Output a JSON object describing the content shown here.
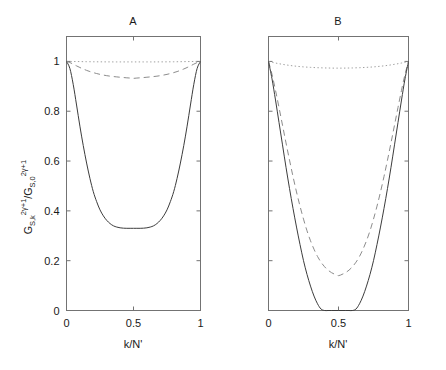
{
  "figure": {
    "background_color": "#ffffff",
    "axis_color": "#737373",
    "solid_color": "#3c3c3c",
    "dashed_color": "#8c8c8c",
    "dotted_color": "#a0a0a0",
    "shared_ylabel": {
      "base1": "G",
      "sub1": "S,k",
      "sup1": "2γ+1",
      "separator": "/",
      "base2": "G",
      "sub2": "S,0",
      "sup2": "2γ+1",
      "plain": "G_{S,k}^{2γ+1}/G_{S,0}^{2γ+1}"
    }
  },
  "chart_data": [
    {
      "type": "line",
      "title": "A",
      "xlabel": "k/N'",
      "ylabel": "G_{S,k}^{2γ+1}/G_{S,0}^{2γ+1}",
      "xlim": [
        0,
        1
      ],
      "ylim": [
        0,
        1.1
      ],
      "xticks": [
        0,
        0.5,
        1
      ],
      "xticklabels": [
        "0",
        "0.5",
        "1"
      ],
      "yticks": [
        0,
        0.2,
        0.4,
        0.6,
        0.8,
        1
      ],
      "yticklabels": [
        "0",
        "0.2",
        "0.4",
        "0.6",
        "0.8",
        "1"
      ],
      "grid": false,
      "legend": "none",
      "x": [
        0,
        0.025,
        0.05,
        0.075,
        0.1,
        0.125,
        0.15,
        0.175,
        0.2,
        0.225,
        0.25,
        0.275,
        0.3,
        0.325,
        0.35,
        0.375,
        0.4,
        0.425,
        0.45,
        0.475,
        0.5,
        0.525,
        0.55,
        0.575,
        0.6,
        0.625,
        0.65,
        0.675,
        0.7,
        0.725,
        0.75,
        0.775,
        0.8,
        0.825,
        0.85,
        0.875,
        0.9,
        0.925,
        0.95,
        0.975,
        1
      ],
      "series": [
        {
          "name": "solid",
          "style": "solid",
          "min_value": 0.33,
          "min_at_x": 0.5,
          "values": [
            1.0,
            0.972,
            0.908,
            0.825,
            0.74,
            0.662,
            0.592,
            0.53,
            0.477,
            0.437,
            0.404,
            0.38,
            0.362,
            0.349,
            0.34,
            0.335,
            0.332,
            0.3305,
            0.33,
            0.33,
            0.33,
            0.33,
            0.33,
            0.3305,
            0.332,
            0.335,
            0.34,
            0.349,
            0.362,
            0.38,
            0.404,
            0.437,
            0.477,
            0.53,
            0.592,
            0.662,
            0.74,
            0.825,
            0.908,
            0.972,
            1.0
          ]
        },
        {
          "name": "dashed",
          "style": "dashed",
          "min_value": 0.932,
          "min_at_x": 0.5,
          "values": [
            1.0,
            0.9955,
            0.989,
            0.982,
            0.9755,
            0.9695,
            0.964,
            0.9592,
            0.955,
            0.9513,
            0.948,
            0.9452,
            0.9428,
            0.9408,
            0.9392,
            0.9378,
            0.9365,
            0.9352,
            0.9341,
            0.9332,
            0.932,
            0.9332,
            0.9341,
            0.9352,
            0.9365,
            0.9378,
            0.9392,
            0.9408,
            0.9428,
            0.9452,
            0.948,
            0.9513,
            0.955,
            0.9592,
            0.964,
            0.9695,
            0.9755,
            0.982,
            0.989,
            0.9955,
            1.0
          ]
        },
        {
          "name": "dotted",
          "style": "dotted",
          "min_value": 0.998,
          "min_at_x": 0.5,
          "values": [
            1.0,
            0.9999,
            0.9997,
            0.9995,
            0.9993,
            0.9991,
            0.9989,
            0.9987,
            0.9985,
            0.9984,
            0.9983,
            0.9982,
            0.9981,
            0.9981,
            0.998,
            0.998,
            0.998,
            0.998,
            0.998,
            0.998,
            0.998,
            0.998,
            0.998,
            0.998,
            0.998,
            0.998,
            0.998,
            0.9981,
            0.9981,
            0.9982,
            0.9983,
            0.9984,
            0.9985,
            0.9987,
            0.9989,
            0.9991,
            0.9993,
            0.9995,
            0.9997,
            0.9999,
            1.0
          ]
        }
      ]
    },
    {
      "type": "line",
      "title": "B",
      "xlabel": "k/N'",
      "ylabel": "G_{S,k}^{2γ+1}/G_{S,0}^{2γ+1}",
      "xlim": [
        0,
        1
      ],
      "ylim": [
        0,
        1.1
      ],
      "xticks": [
        0,
        0.5,
        1
      ],
      "xticklabels": [
        "0",
        "0.5",
        "1"
      ],
      "yticks": [
        0,
        0.2,
        0.4,
        0.6,
        0.8,
        1
      ],
      "yticklabels": [
        "0",
        "0.2",
        "0.4",
        "0.6",
        "0.8",
        "1"
      ],
      "grid": false,
      "legend": "none",
      "x": [
        0,
        0.025,
        0.05,
        0.075,
        0.1,
        0.125,
        0.15,
        0.175,
        0.2,
        0.225,
        0.25,
        0.275,
        0.3,
        0.325,
        0.35,
        0.375,
        0.4,
        0.425,
        0.45,
        0.475,
        0.5,
        0.525,
        0.55,
        0.575,
        0.6,
        0.625,
        0.65,
        0.675,
        0.7,
        0.725,
        0.75,
        0.775,
        0.8,
        0.825,
        0.85,
        0.875,
        0.9,
        0.925,
        0.95,
        0.975,
        1
      ],
      "series": [
        {
          "name": "solid",
          "style": "solid",
          "min_value": 0.0,
          "min_at_x": 0.5,
          "flat_zero_range": [
            0.37,
            0.63
          ],
          "values": [
            1.0,
            0.93,
            0.845,
            0.755,
            0.665,
            0.575,
            0.49,
            0.41,
            0.335,
            0.265,
            0.2,
            0.145,
            0.098,
            0.058,
            0.027,
            0.006,
            0.0,
            0.0,
            0.0,
            0.0,
            0.0,
            0.0,
            0.0,
            0.0,
            0.0,
            0.006,
            0.027,
            0.058,
            0.098,
            0.145,
            0.2,
            0.265,
            0.335,
            0.41,
            0.49,
            0.575,
            0.665,
            0.755,
            0.845,
            0.93,
            1.0
          ]
        },
        {
          "name": "dashed",
          "style": "dashed",
          "min_value": 0.14,
          "min_at_x": 0.5,
          "values": [
            1.0,
            0.948,
            0.884,
            0.815,
            0.744,
            0.673,
            0.604,
            0.538,
            0.476,
            0.419,
            0.367,
            0.32,
            0.28,
            0.246,
            0.217,
            0.194,
            0.176,
            0.162,
            0.152,
            0.145,
            0.14,
            0.145,
            0.152,
            0.162,
            0.176,
            0.194,
            0.217,
            0.246,
            0.28,
            0.32,
            0.367,
            0.419,
            0.476,
            0.538,
            0.604,
            0.673,
            0.744,
            0.815,
            0.884,
            0.948,
            1.0
          ]
        },
        {
          "name": "dotted",
          "style": "dotted",
          "min_value": 0.973,
          "min_at_x": 0.5,
          "values": [
            1.0,
            0.9965,
            0.9935,
            0.9908,
            0.9883,
            0.986,
            0.984,
            0.9822,
            0.9806,
            0.9792,
            0.978,
            0.977,
            0.9761,
            0.9754,
            0.9748,
            0.9743,
            0.9738,
            0.9735,
            0.9732,
            0.973,
            0.973,
            0.973,
            0.9732,
            0.9735,
            0.9738,
            0.9743,
            0.9748,
            0.9754,
            0.9761,
            0.977,
            0.978,
            0.9792,
            0.9806,
            0.9822,
            0.984,
            0.986,
            0.9883,
            0.9908,
            0.9935,
            0.9965,
            1.0
          ]
        }
      ]
    }
  ]
}
